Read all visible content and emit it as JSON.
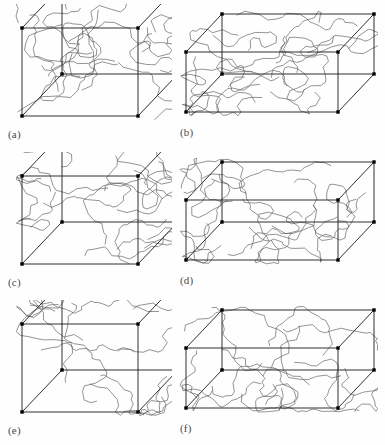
{
  "figure": {
    "type": "scientific-figure",
    "rows": 3,
    "columns": 2,
    "background_color": "#ffffff",
    "box_edge_color": "#1a1a1a",
    "chain_color": "#5a5a5a",
    "vertex_color": "#000000",
    "label_color": "#4a4a4a"
  },
  "panels": [
    {
      "id": "a",
      "label": "(a)",
      "shape": "cube",
      "width": 166,
      "height": 126,
      "box": {
        "origin_x": 16,
        "origin_y": 112,
        "w": 116,
        "h": 88,
        "depth_x": 40,
        "depth_y": -42
      },
      "chain_count": 14,
      "chain_seed": 11,
      "chain_segments": 17,
      "chain_amplitude": 17
    },
    {
      "id": "b",
      "label": "(b)",
      "shape": "elongated-box",
      "width": 200,
      "height": 122,
      "box": {
        "origin_x": 8,
        "origin_y": 104,
        "w": 152,
        "h": 60,
        "depth_x": 36,
        "depth_y": -38
      },
      "chain_count": 15,
      "chain_seed": 27,
      "chain_segments": 18,
      "chain_amplitude": 15
    },
    {
      "id": "c",
      "label": "(c)",
      "shape": "cube",
      "width": 166,
      "height": 126,
      "box": {
        "origin_x": 16,
        "origin_y": 112,
        "w": 116,
        "h": 88,
        "depth_x": 40,
        "depth_y": -42
      },
      "chain_count": 14,
      "chain_seed": 43,
      "chain_segments": 17,
      "chain_amplitude": 17
    },
    {
      "id": "d",
      "label": "(d)",
      "shape": "elongated-box",
      "width": 200,
      "height": 122,
      "box": {
        "origin_x": 8,
        "origin_y": 104,
        "w": 152,
        "h": 60,
        "depth_x": 36,
        "depth_y": -38
      },
      "chain_count": 15,
      "chain_seed": 59,
      "chain_segments": 18,
      "chain_amplitude": 15
    },
    {
      "id": "e",
      "label": "(e)",
      "shape": "cube",
      "width": 166,
      "height": 126,
      "box": {
        "origin_x": 16,
        "origin_y": 112,
        "w": 116,
        "h": 88,
        "depth_x": 40,
        "depth_y": -42
      },
      "chain_count": 13,
      "chain_seed": 71,
      "chain_segments": 17,
      "chain_amplitude": 17
    },
    {
      "id": "f",
      "label": "(f)",
      "shape": "elongated-box",
      "width": 200,
      "height": 122,
      "box": {
        "origin_x": 8,
        "origin_y": 104,
        "w": 152,
        "h": 60,
        "depth_x": 36,
        "depth_y": -38
      },
      "chain_count": 14,
      "chain_seed": 89,
      "chain_segments": 18,
      "chain_amplitude": 15
    }
  ]
}
